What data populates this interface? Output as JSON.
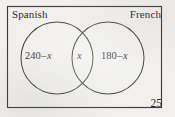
{
  "figure": {
    "type": "venn-diagram",
    "sets": 2,
    "universe_label_visible": false,
    "colors": {
      "background": "#f1f0ee",
      "stroke": "#3c3c3c",
      "text": "#2a2a2a"
    },
    "rectangle": {
      "name": "universal-set-rectangle",
      "x": 7.5,
      "y": 6.5,
      "width": 154,
      "height": 101
    },
    "circles": [
      {
        "name": "spanish-circle",
        "cx": 57,
        "cy": 58,
        "r": 36
      },
      {
        "name": "french-circle",
        "cx": 108,
        "cy": 58,
        "r": 36
      }
    ],
    "labels": {
      "left_set": "Spanish",
      "right_set": "French"
    },
    "regions": {
      "left_only": {
        "label": "240",
        "operator": "–",
        "variable": "x"
      },
      "intersection": {
        "variable": "x"
      },
      "right_only": {
        "label": "180",
        "operator": "–",
        "variable": "x"
      },
      "outside": {
        "value": "25"
      }
    }
  }
}
